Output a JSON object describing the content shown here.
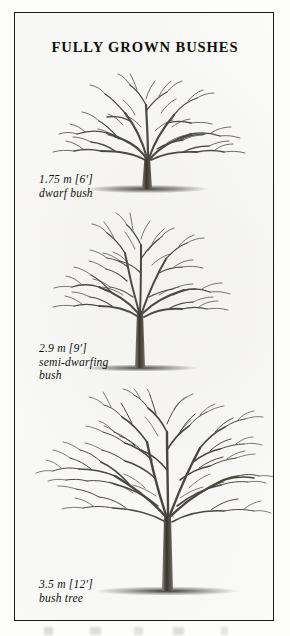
{
  "plate": {
    "title": "FULLY GROWN BUSHES",
    "border_color": "#1a1a1a",
    "paper_color": "#fefefd",
    "ink_color": "#4a4742"
  },
  "figures": [
    {
      "id": "dwarf-bush",
      "caption_size": "1.75 m [6']",
      "caption_name": "dwarf bush",
      "height_m": 1.75,
      "height_ft": 6,
      "form": "wide spreading bush, very short trunk"
    },
    {
      "id": "semi-dwarfing-bush",
      "caption_size": "2.9 m [9']",
      "caption_name_line1": "semi-dwarfing",
      "caption_name_line2": "bush",
      "height_m": 2.9,
      "height_ft": 9,
      "form": "upright bush, medium trunk"
    },
    {
      "id": "bush-tree",
      "caption_size": "3.5 m [12']",
      "caption_name": "bush tree",
      "height_m": 3.5,
      "height_ft": 12,
      "form": "large open tree, tall trunk"
    }
  ]
}
